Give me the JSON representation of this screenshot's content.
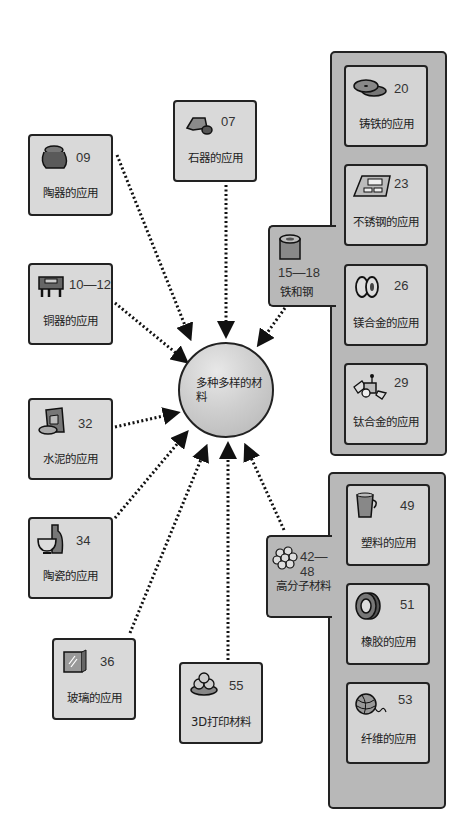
{
  "hub": {
    "title": "多种多样的材料"
  },
  "cards": {
    "stone": {
      "num": "07",
      "label": "石器的应用",
      "icon": "stone-tool-icon"
    },
    "pottery": {
      "num": "09",
      "label": "陶器的应用",
      "icon": "pottery-icon"
    },
    "bronze": {
      "num": "10—12",
      "label": "铜器的应用",
      "icon": "bronze-vessel-icon"
    },
    "cement": {
      "num": "32",
      "label": "水泥的应用",
      "icon": "cement-icon"
    },
    "ceramic": {
      "num": "34",
      "label": "陶瓷的应用",
      "icon": "ceramic-vase-icon"
    },
    "glass": {
      "num": "36",
      "label": "玻璃的应用",
      "icon": "glass-pane-icon"
    },
    "print3d": {
      "num": "55",
      "label": "3D打印材料",
      "icon": "3d-print-icon"
    }
  },
  "iron_group": {
    "num": "15—18",
    "label": "铁和钢",
    "icon": "steel-roll-icon",
    "items": [
      {
        "num": "20",
        "label": "铸铁的应用",
        "icon": "cast-iron-pan-icon"
      },
      {
        "num": "23",
        "label": "不锈钢的应用",
        "icon": "stainless-tray-icon"
      },
      {
        "num": "26",
        "label": "镁合金的应用",
        "icon": "magnesium-wheel-icon"
      },
      {
        "num": "29",
        "label": "钛合金的应用",
        "icon": "satellite-icon"
      }
    ]
  },
  "polymer_group": {
    "num": "42—48",
    "label": "高分子材料",
    "icon": "molecule-icon",
    "items": [
      {
        "num": "49",
        "label": "塑料的应用",
        "icon": "plastic-cup-icon"
      },
      {
        "num": "51",
        "label": "橡胶的应用",
        "icon": "rubber-tire-icon"
      },
      {
        "num": "53",
        "label": "纤维的应用",
        "icon": "yarn-ball-icon"
      }
    ]
  },
  "colors": {
    "card": "#d9d9d9",
    "group": "#b8b8b8",
    "border": "#222222",
    "hub": "#cfcfcf"
  }
}
